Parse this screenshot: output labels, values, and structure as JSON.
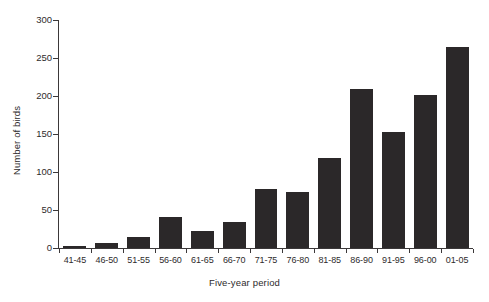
{
  "chart_data": {
    "type": "bar",
    "title": "",
    "xlabel": "Five-year period",
    "ylabel": "Number of birds",
    "categories": [
      "41-45",
      "46-50",
      "51-55",
      "56-60",
      "61-65",
      "66-70",
      "71-75",
      "76-80",
      "81-85",
      "86-90",
      "91-95",
      "96-00",
      "01-05"
    ],
    "values": [
      3,
      6,
      15,
      41,
      22,
      34,
      77,
      74,
      118,
      209,
      152,
      201,
      265
    ],
    "ylim": [
      0,
      300
    ],
    "yticks": [
      0,
      50,
      100,
      150,
      200,
      250,
      300
    ],
    "ytick_labels": [
      "0",
      "50",
      "100",
      "150",
      "200",
      "250",
      "300"
    ],
    "grid": false,
    "legend": null,
    "bar_color": "#2b2829",
    "axis_color": "#3b3839",
    "background": "#ffffff"
  }
}
